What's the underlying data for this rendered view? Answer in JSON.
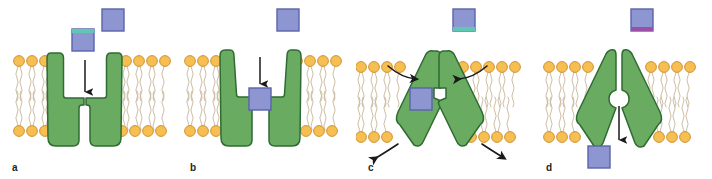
{
  "figure": {
    "width": 712,
    "height": 179,
    "background_color": "#ffffff"
  },
  "colors": {
    "protein_fill": "#6aab62",
    "protein_stroke": "#2f6b33",
    "lipid_head_fill": "#f7bf52",
    "lipid_head_stroke": "#c98a28",
    "lipid_tail_stroke": "#c8b79a",
    "substrate_fill": "#8e96d2",
    "substrate_stroke": "#5b63ab",
    "substrate_accent_teal": "#5fc8b4",
    "substrate_accent_purple": "#9c4fa8",
    "arrow_color": "#1a1a1a",
    "label_color": "#231f20"
  },
  "panels": [
    {
      "id": "a",
      "label": "a",
      "state_name": "outward-open-unbound",
      "protein_shape": "outward-open-funnel",
      "pore_open_side": "outward",
      "arrow": {
        "type": "straight",
        "direction": "down",
        "name": "substrate-entry-arrow"
      },
      "substrates": [
        {
          "name": "substrate-free-upper-right",
          "position": "upper-right",
          "accent": "none",
          "x": 102,
          "y": 9,
          "size": 22
        },
        {
          "name": "substrate-approaching-pore",
          "position": "above-pore",
          "accent": "teal-top",
          "x": 72,
          "y": 29,
          "size": 22
        }
      ],
      "curved_arrows": []
    },
    {
      "id": "b",
      "label": "b",
      "state_name": "outward-open-bound",
      "protein_shape": "outward-open-funnel",
      "pore_open_side": "outward",
      "arrow": {
        "type": "straight",
        "direction": "down",
        "name": "substrate-binding-arrow"
      },
      "substrates": [
        {
          "name": "substrate-free-above-membrane",
          "position": "top-center",
          "accent": "none",
          "x": 277,
          "y": 9,
          "size": 22
        },
        {
          "name": "substrate-bound-in-site",
          "position": "binding-site",
          "accent": "none",
          "x": 231,
          "y": 88,
          "size": 22
        }
      ],
      "curved_arrows": []
    },
    {
      "id": "c",
      "label": "c",
      "state_name": "occluded-conformational-change",
      "protein_shape": "occluded-inverted-v",
      "pore_open_side": "none",
      "arrow": null,
      "substrates": [
        {
          "name": "substrate-free-above-membrane",
          "position": "top-center",
          "accent": "teal-bottom",
          "x": 453,
          "y": 9,
          "size": 22
        },
        {
          "name": "substrate-occluded-in-site",
          "position": "binding-site",
          "accent": "none",
          "x": 410,
          "y": 88,
          "size": 22
        }
      ],
      "curved_arrows": [
        {
          "name": "conformation-arrow-top-left",
          "side": "top-left"
        },
        {
          "name": "conformation-arrow-top-right",
          "side": "top-right"
        },
        {
          "name": "conformation-arrow-bottom-left",
          "side": "bottom-left"
        },
        {
          "name": "conformation-arrow-bottom-right",
          "side": "bottom-right"
        }
      ]
    },
    {
      "id": "d",
      "label": "d",
      "state_name": "inward-open-release",
      "protein_shape": "inward-open-inverted-v",
      "pore_open_side": "inward",
      "arrow": {
        "type": "straight",
        "direction": "down",
        "name": "substrate-release-arrow"
      },
      "substrates": [
        {
          "name": "substrate-free-above-membrane",
          "position": "top-center",
          "accent": "purple-bottom",
          "x": 631,
          "y": 9,
          "size": 22
        },
        {
          "name": "substrate-released-below-membrane",
          "position": "below-membrane",
          "accent": "none",
          "x": 588,
          "y": 146,
          "size": 22
        }
      ],
      "curved_arrows": []
    }
  ]
}
